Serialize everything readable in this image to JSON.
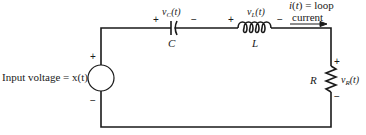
{
  "diagram": {
    "type": "series RLC circuit",
    "stroke_color": "#1a1a1a",
    "background": "#ffffff",
    "source": {
      "label": "Input voltage = x(t)",
      "plus": "+",
      "minus": "−"
    },
    "capacitor": {
      "name": "C",
      "voltage_var": "v",
      "voltage_sub": "C",
      "voltage_arg": "(t)",
      "plus": "+",
      "minus": "−"
    },
    "inductor": {
      "name": "L",
      "voltage_var": "v",
      "voltage_sub": "L",
      "voltage_arg": "(t)",
      "plus": "+",
      "minus": "−"
    },
    "resistor": {
      "name": "R",
      "voltage_var": "v",
      "voltage_sub": "R",
      "voltage_arg": "(t)",
      "plus": "+",
      "minus": "−"
    },
    "current": {
      "line1": "i(t) = loop",
      "line2": "current"
    }
  }
}
